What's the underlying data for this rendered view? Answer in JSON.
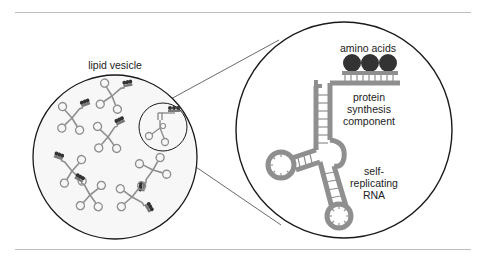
{
  "labels": {
    "vesicle": "lipid vesicle",
    "amino_acids": "amino acids",
    "protein_line1": "protein",
    "protein_line2": "synthesis",
    "protein_line3": "component",
    "rna_line1": "self-",
    "rna_line2": "replicating",
    "rna_line3": "RNA"
  },
  "colors": {
    "outline": "#1a1a1a",
    "rna_strand": "#8f8f8f",
    "amino_acid": "#333333",
    "rule": "#bdbdbd",
    "vesicle_fill": "#f7f7f7"
  },
  "diagram": {
    "vesicle": {
      "cx": 115,
      "cy": 157,
      "r": 82
    },
    "magnifier": {
      "cx": 163,
      "cy": 127,
      "r": 24
    },
    "zoom_circle": {
      "cx": 344,
      "cy": 130,
      "r": 108
    },
    "rna_count_in_vesicle": 8,
    "amino_acid_count": 3
  }
}
